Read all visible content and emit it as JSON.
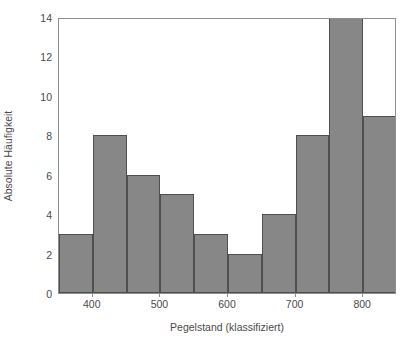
{
  "chart_data": {
    "type": "bar",
    "title": "",
    "xlabel": "Pegelstand (klassifiziert)",
    "ylabel": "Absolute Häufigkeit",
    "xlim": [
      350,
      850
    ],
    "ylim": [
      0,
      14
    ],
    "grid": false,
    "legend": null,
    "bin_width": 50,
    "bin_edges": [
      350,
      400,
      450,
      500,
      550,
      600,
      650,
      700,
      750,
      800,
      850
    ],
    "categories": [
      "350-400",
      "400-450",
      "450-500",
      "500-550",
      "550-600",
      "600-650",
      "650-700",
      "700-750",
      "750-800",
      "800-850"
    ],
    "values": [
      3,
      8,
      6,
      5,
      3,
      2,
      4,
      8,
      14,
      9
    ],
    "xticks": [
      400,
      500,
      600,
      700,
      800
    ],
    "xtick_labels": [
      "400",
      "500",
      "600",
      "700",
      "800"
    ],
    "yticks": [
      0,
      2,
      4,
      6,
      8,
      10,
      12,
      14
    ],
    "ytick_labels": [
      "0",
      "2",
      "4",
      "6",
      "8",
      "10",
      "12",
      "14"
    ],
    "colors": {
      "bar_fill": "#878787",
      "bar_edge": "#4f4f4f",
      "axis": "#8d8d8d",
      "text": "#4a4a4a",
      "background": "#ffffff"
    }
  }
}
